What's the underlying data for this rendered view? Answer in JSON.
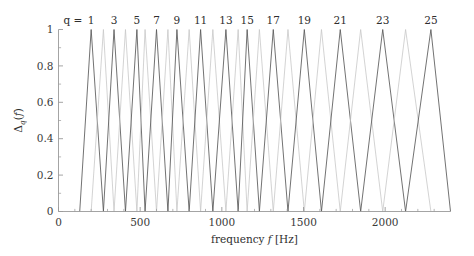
{
  "chart_data": {
    "type": "line",
    "title": "",
    "xlabel": "frequency f [Hz]",
    "ylabel": "Δ_q(f)",
    "xlim": [
      0,
      2400
    ],
    "ylim": [
      0,
      1
    ],
    "grid": false,
    "legend": "none",
    "series_label_prefix": "q =",
    "xticks": [
      0,
      500,
      1000,
      1500,
      2000
    ],
    "xticklabels": [
      "0",
      "500",
      "1000",
      "1500",
      "2000"
    ],
    "xminorticks": [
      100,
      200,
      300,
      400,
      600,
      700,
      800,
      900,
      1100,
      1200,
      1300,
      1400,
      1600,
      1700,
      1800,
      1900,
      2100,
      2200,
      2300
    ],
    "yticks": [
      0,
      0.2,
      0.4,
      0.6,
      0.8,
      1
    ],
    "yticklabels": [
      "0",
      "0.2",
      "0.4",
      "0.6",
      "0.8",
      "1"
    ],
    "peak_labels": [
      "1",
      "3",
      "5",
      "7",
      "9",
      "11",
      "13",
      "15",
      "17",
      "19",
      "21",
      "23",
      "25"
    ],
    "filters": [
      {
        "q": 1,
        "left": 130,
        "peak": 200,
        "right": 275,
        "labeled": true,
        "label": "1"
      },
      {
        "q": 2,
        "left": 200,
        "peak": 275,
        "right": 340,
        "labeled": false,
        "label": ""
      },
      {
        "q": 3,
        "left": 275,
        "peak": 340,
        "right": 410,
        "labeled": true,
        "label": "3"
      },
      {
        "q": 4,
        "left": 340,
        "peak": 410,
        "right": 480,
        "labeled": false,
        "label": ""
      },
      {
        "q": 5,
        "left": 410,
        "peak": 480,
        "right": 530,
        "labeled": true,
        "label": "5"
      },
      {
        "q": 6,
        "left": 480,
        "peak": 530,
        "right": 600,
        "labeled": false,
        "label": ""
      },
      {
        "q": 7,
        "left": 530,
        "peak": 600,
        "right": 670,
        "labeled": true,
        "label": "7"
      },
      {
        "q": 8,
        "left": 600,
        "peak": 670,
        "right": 725,
        "labeled": false,
        "label": ""
      },
      {
        "q": 9,
        "left": 670,
        "peak": 725,
        "right": 800,
        "labeled": true,
        "label": "9"
      },
      {
        "q": 10,
        "left": 725,
        "peak": 800,
        "right": 870,
        "labeled": false,
        "label": ""
      },
      {
        "q": 11,
        "left": 800,
        "peak": 870,
        "right": 945,
        "labeled": true,
        "label": "11"
      },
      {
        "q": 12,
        "left": 870,
        "peak": 945,
        "right": 1025,
        "labeled": false,
        "label": ""
      },
      {
        "q": 13,
        "left": 945,
        "peak": 1025,
        "right": 1100,
        "labeled": true,
        "label": "13"
      },
      {
        "q": 14,
        "left": 1025,
        "peak": 1100,
        "right": 1155,
        "labeled": false,
        "label": ""
      },
      {
        "q": 15,
        "left": 1100,
        "peak": 1155,
        "right": 1230,
        "labeled": true,
        "label": "15"
      },
      {
        "q": 16,
        "left": 1155,
        "peak": 1230,
        "right": 1315,
        "labeled": false,
        "label": ""
      },
      {
        "q": 17,
        "left": 1230,
        "peak": 1315,
        "right": 1405,
        "labeled": true,
        "label": "17"
      },
      {
        "q": 18,
        "left": 1315,
        "peak": 1405,
        "right": 1505,
        "labeled": false,
        "label": ""
      },
      {
        "q": 19,
        "left": 1405,
        "peak": 1505,
        "right": 1610,
        "labeled": true,
        "label": "19"
      },
      {
        "q": 20,
        "left": 1505,
        "peak": 1610,
        "right": 1725,
        "labeled": false,
        "label": ""
      },
      {
        "q": 21,
        "left": 1610,
        "peak": 1725,
        "right": 1850,
        "labeled": true,
        "label": "21"
      },
      {
        "q": 22,
        "left": 1725,
        "peak": 1850,
        "right": 1985,
        "labeled": false,
        "label": ""
      },
      {
        "q": 23,
        "left": 1850,
        "peak": 1985,
        "right": 2125,
        "labeled": true,
        "label": "23"
      },
      {
        "q": 24,
        "left": 1985,
        "peak": 2125,
        "right": 2280,
        "labeled": false,
        "label": ""
      },
      {
        "q": 25,
        "left": 2125,
        "peak": 2280,
        "right": 2400,
        "labeled": true,
        "label": "25"
      }
    ],
    "colors": {
      "line_dark": "#595959",
      "line_light": "#c8c8c8",
      "axis": "#9a9a9a",
      "text": "#2e2e2e",
      "background": "#ffffff"
    }
  }
}
